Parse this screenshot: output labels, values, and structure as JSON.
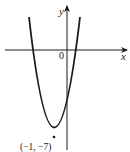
{
  "figure": {
    "axes": {
      "x_label": "x",
      "y_label": "y",
      "origin_label": "0"
    },
    "curve": {
      "type": "parabola",
      "vertex_label": "(−1, −7)",
      "vertex": [
        -1,
        -7
      ],
      "opens": "up"
    },
    "colors": {
      "stroke": "#1a1a1a",
      "background": "#ffffff"
    }
  }
}
